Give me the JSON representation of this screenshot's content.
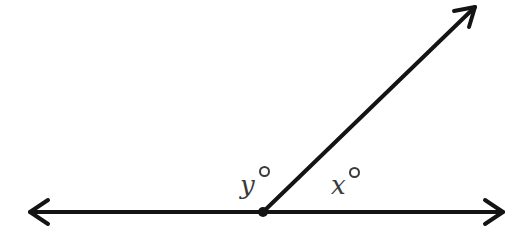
{
  "diagram": {
    "type": "angle-diagram",
    "stroke_color": "#141414",
    "label_color": "#3a3a3a",
    "background": "#ffffff",
    "vertex": {
      "x": 263,
      "y": 212
    },
    "horizontal_line": {
      "left_tip": {
        "x": 28,
        "y": 212
      },
      "right_tip": {
        "x": 505,
        "y": 212
      },
      "arrowheads": [
        "left",
        "right"
      ]
    },
    "ray": {
      "from": {
        "x": 263,
        "y": 212
      },
      "to": {
        "x": 477,
        "y": 5
      },
      "arrowhead": "end"
    },
    "labels": [
      {
        "id": "angle-y",
        "variable": "y",
        "degree_symbol": "°",
        "text": "y°",
        "position": "left of ray, above line"
      },
      {
        "id": "angle-x",
        "variable": "x",
        "degree_symbol": "°",
        "text": "x°",
        "position": "right of ray, above line"
      }
    ]
  }
}
